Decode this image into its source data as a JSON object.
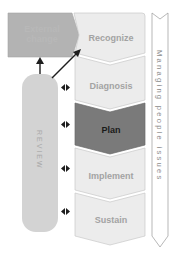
{
  "diagram": {
    "external_box": {
      "label_line1": "External",
      "label_line2": "change"
    },
    "review": {
      "label": "REVIEW"
    },
    "stages": [
      {
        "label": "Recognize",
        "active": false
      },
      {
        "label": "Diagnosis",
        "active": false
      },
      {
        "label": "Plan",
        "active": true
      },
      {
        "label": "Implement",
        "active": false
      },
      {
        "label": "Sustain",
        "active": false
      }
    ],
    "side_arrow": {
      "label": "Managing people issues"
    },
    "colors": {
      "stage_fill": "#ececec",
      "stage_active_fill": "#7a7a7a",
      "external_fill": "#b3b3b3",
      "review_fill": "#d3d3d3",
      "arrow_stroke": "#1e1e1e"
    }
  }
}
